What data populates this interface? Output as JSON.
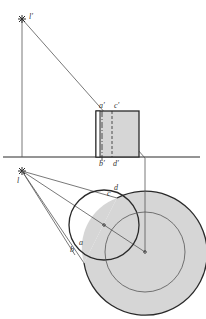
{
  "colors": {
    "line": "#2a2a2a",
    "thin_line": "#555555",
    "shadow_fill": "#d6d6d6",
    "background": "#ffffff"
  },
  "labels": {
    "light_front": "l′",
    "light_top": "l",
    "a_front": "a′",
    "c_front": "c′",
    "b_front": "b′",
    "d_front": "d′",
    "a_top": "a",
    "b_top": "b",
    "c_top": "c",
    "d_top": "d"
  }
}
